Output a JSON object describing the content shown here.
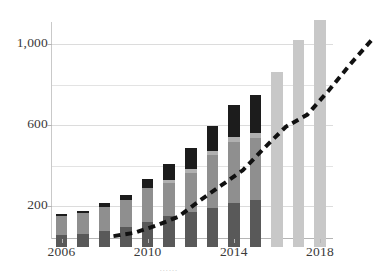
{
  "chart_data": {
    "type": "bar",
    "title": "",
    "subtitle": "",
    "xlabel": "",
    "ylabel": "",
    "stacked": true,
    "grid": true,
    "legend": "none",
    "xlim": [
      2005.5,
      2018.5
    ],
    "ylim": [
      0,
      1150
    ],
    "y_ticks": [
      200,
      600,
      1000
    ],
    "y_tick_labels": [
      "200",
      "600",
      "1,000"
    ],
    "y_minor_ticks": [
      400,
      800
    ],
    "x_ticks": [
      2006,
      2010,
      2014,
      2018
    ],
    "x_tick_labels": [
      "2006",
      "2010",
      "2014",
      "2018"
    ],
    "categories": [
      "2006",
      "2007",
      "2008",
      "2009",
      "2010",
      "2011",
      "2012",
      "2013",
      "2014",
      "2015",
      "2016",
      "2017",
      "2018"
    ],
    "series": [
      {
        "name": "segment-1",
        "color": "#595959",
        "values": [
          55,
          60,
          75,
          95,
          120,
          150,
          170,
          190,
          215,
          230,
          0,
          0,
          0
        ]
      },
      {
        "name": "segment-2",
        "color": "#8f8f8f",
        "values": [
          95,
          105,
          120,
          135,
          170,
          165,
          195,
          260,
          300,
          305,
          0,
          0,
          0
        ]
      },
      {
        "name": "segment-3",
        "color": "#b0b0b0",
        "values": [
          0,
          0,
          0,
          0,
          0,
          15,
          20,
          20,
          25,
          25,
          0,
          0,
          0
        ]
      },
      {
        "name": "segment-4",
        "color": "#1c1c1c",
        "values": [
          10,
          12,
          18,
          25,
          45,
          80,
          100,
          125,
          160,
          190,
          0,
          0,
          0
        ]
      },
      {
        "name": "forecast",
        "color": "#c8c8c8",
        "values": [
          0,
          0,
          0,
          0,
          0,
          0,
          0,
          0,
          0,
          0,
          860,
          1020,
          1120
        ]
      }
    ],
    "totals": [
      160,
      177,
      213,
      255,
      335,
      410,
      485,
      595,
      700,
      750,
      860,
      1020,
      1120
    ],
    "trend_line": {
      "name": "trend",
      "style": "dashed",
      "color": "#111111",
      "width": 4,
      "x": [
        2006,
        2007,
        2008,
        2009,
        2010,
        2011,
        2012,
        2013,
        2014,
        2015,
        2016,
        2017,
        2018
      ],
      "values": [
        160,
        177,
        213,
        255,
        335,
        410,
        485,
        595,
        700,
        760,
        880,
        1010,
        1130
      ]
    }
  },
  "caption": {
    "text": "……"
  }
}
